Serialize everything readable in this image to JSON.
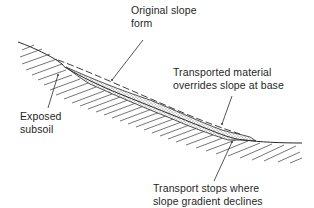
{
  "diagram": {
    "type": "slope-profile-cross-section",
    "labels": {
      "original_slope": [
        "Original slope",
        "form"
      ],
      "transported_material": [
        "Transported material",
        "overrides slope at base"
      ],
      "exposed_subsoil": [
        "Exposed",
        "subsoil"
      ],
      "transport_stops": [
        "Transport stops where",
        "slope gradient declines"
      ]
    },
    "colors": {
      "line": "#2a2a2a",
      "hatch": "#3a3a3a",
      "stipple": "#555555",
      "background": "#ffffff"
    }
  }
}
